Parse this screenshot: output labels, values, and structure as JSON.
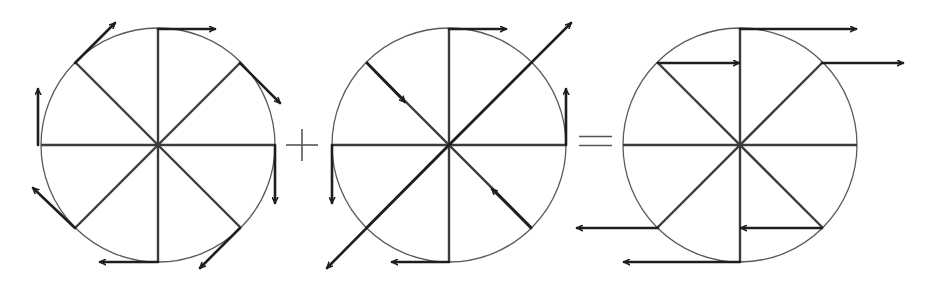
{
  "diagram": {
    "colors": {
      "background": "#ffffff",
      "circle": "#5a5a5a",
      "spoke": "#3c3c3c",
      "arrow": "#1e1e1e"
    },
    "operators": [
      {
        "name": "plus",
        "symbol": "+",
        "cx": 302,
        "cy": 145
      },
      {
        "name": "equals",
        "symbol": "=",
        "cx": 596,
        "cy": 141
      }
    ],
    "panels": [
      {
        "name": "rotation-field",
        "center": [
          158,
          145
        ],
        "radius": 117,
        "arrows": [
          {
            "from": [
              158,
              29
            ],
            "to": [
              215,
              29
            ]
          },
          {
            "from": [
              240,
              63
            ],
            "to": [
              280,
              103
            ]
          },
          {
            "from": [
              275,
              145
            ],
            "to": [
              275,
              203
            ]
          },
          {
            "from": [
              240,
              228
            ],
            "to": [
              200,
              268
            ]
          },
          {
            "from": [
              158,
              262
            ],
            "to": [
              100,
              262
            ]
          },
          {
            "from": [
              75,
              228
            ],
            "to": [
              33,
              188
            ]
          },
          {
            "from": [
              38,
              145
            ],
            "to": [
              38,
              89
            ]
          },
          {
            "from": [
              75,
              63
            ],
            "to": [
              115,
              23
            ]
          }
        ]
      },
      {
        "name": "strain-field",
        "center": [
          449,
          145
        ],
        "radius": 117,
        "arrows": [
          {
            "from": [
              449,
              29
            ],
            "to": [
              506,
              29
            ]
          },
          {
            "from": [
              449,
              145
            ],
            "to": [
              571,
              23
            ]
          },
          {
            "from": [
              566,
              145
            ],
            "to": [
              566,
              89
            ]
          },
          {
            "from": [
              531,
              228
            ],
            "to": [
              492,
              189
            ]
          },
          {
            "from": [
              449,
              262
            ],
            "to": [
              392,
              262
            ]
          },
          {
            "from": [
              449,
              145
            ],
            "to": [
              327,
              268
            ]
          },
          {
            "from": [
              332,
              145
            ],
            "to": [
              332,
              203
            ]
          },
          {
            "from": [
              367,
              63
            ],
            "to": [
              405,
              102
            ]
          }
        ]
      },
      {
        "name": "resultant-field",
        "center": [
          740,
          145
        ],
        "radius": 117,
        "arrows": [
          {
            "from": [
              740,
              29
            ],
            "to": [
              856,
              29
            ]
          },
          {
            "from": [
              822,
              63
            ],
            "to": [
              903,
              63
            ]
          },
          {
            "from": [
              822,
              228
            ],
            "to": [
              741,
              228
            ]
          },
          {
            "from": [
              740,
              262
            ],
            "to": [
              624,
              262
            ]
          },
          {
            "from": [
              658,
              228
            ],
            "to": [
              577,
              228
            ]
          },
          {
            "from": [
              658,
              63
            ],
            "to": [
              739,
              63
            ]
          }
        ]
      }
    ]
  }
}
